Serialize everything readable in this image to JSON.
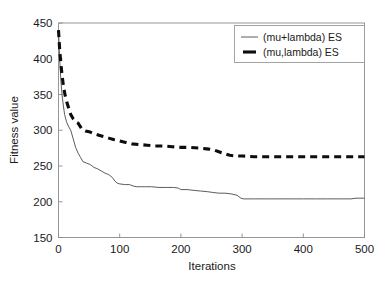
{
  "chart_data": {
    "type": "line",
    "title": "",
    "xlabel": "Iterations",
    "ylabel": "Fitness value",
    "xlim": [
      0,
      500
    ],
    "ylim": [
      150,
      450
    ],
    "xticks": [
      0,
      100,
      200,
      300,
      400,
      500
    ],
    "yticks": [
      150,
      200,
      250,
      300,
      350,
      400,
      450
    ],
    "xtick_labels": [
      "0",
      "100",
      "200",
      "300",
      "400",
      "500"
    ],
    "ytick_labels": [
      "150",
      "200",
      "250",
      "300",
      "350",
      "400",
      "450"
    ],
    "grid": false,
    "legend_position": "upper right",
    "series": [
      {
        "name": "(mu+lambda) ES",
        "style": "solid",
        "color": "#4a4a4a",
        "x": [
          0,
          2,
          4,
          6,
          8,
          10,
          13,
          16,
          20,
          24,
          28,
          32,
          36,
          40,
          46,
          52,
          58,
          64,
          70,
          76,
          82,
          88,
          92,
          96,
          100,
          108,
          116,
          122,
          128,
          134,
          142,
          152,
          164,
          176,
          188,
          196,
          200,
          210,
          220,
          232,
          244,
          252,
          262,
          272,
          282,
          292,
          298,
          302,
          320,
          340,
          360,
          380,
          400,
          420,
          440,
          460,
          478,
          486,
          500
        ],
        "y": [
          440,
          398,
          368,
          348,
          334,
          322,
          312,
          306,
          300,
          288,
          276,
          268,
          262,
          256,
          254,
          252,
          248,
          246,
          243,
          240,
          238,
          234,
          229,
          226,
          225,
          224,
          224,
          222,
          221,
          221,
          221,
          221,
          220,
          220,
          220,
          219,
          217,
          217,
          216,
          215,
          214,
          213,
          212,
          212,
          211,
          209,
          205,
          204,
          204,
          204,
          204,
          204,
          204,
          204,
          204,
          204,
          204,
          205,
          205
        ]
      },
      {
        "name": "(mu,lambda) ES",
        "style": "dashed",
        "color": "#0d0d0d",
        "x": [
          0,
          2,
          4,
          6,
          8,
          11,
          14,
          17,
          20,
          24,
          28,
          32,
          38,
          44,
          50,
          58,
          66,
          74,
          82,
          90,
          100,
          110,
          120,
          132,
          145,
          158,
          172,
          186,
          200,
          215,
          230,
          242,
          252,
          262,
          272,
          280,
          290,
          300,
          320,
          340,
          360,
          380,
          400,
          420,
          440,
          460,
          480,
          500
        ],
        "y": [
          440,
          412,
          392,
          376,
          362,
          348,
          338,
          330,
          322,
          316,
          312,
          310,
          302,
          299,
          298,
          295,
          293,
          291,
          289,
          287,
          285,
          283,
          281,
          280,
          279,
          278,
          278,
          277,
          276,
          276,
          275,
          274,
          273,
          270,
          267,
          265,
          264,
          264,
          263,
          263,
          263,
          263,
          263,
          263,
          263,
          263,
          263,
          263
        ]
      }
    ],
    "legend": [
      {
        "label": "(mu+lambda) ES",
        "style": "solid"
      },
      {
        "label": "(mu,lambda) ES",
        "style": "dashed"
      }
    ]
  }
}
